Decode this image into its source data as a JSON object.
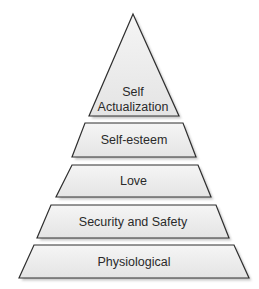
{
  "diagram": {
    "type": "pyramid",
    "colors": {
      "fill_top": "#f5f5f5",
      "fill_bottom": "#e4e4e4",
      "stroke": "#2f2f2f",
      "shadow": "#9a9a9a",
      "text": "#2a2a2a"
    },
    "tiers": [
      {
        "id": "self-actualization",
        "lines": [
          "Self",
          "Actualization"
        ],
        "points": [
          [
            133,
            14
          ],
          [
            179,
            116
          ],
          [
            89,
            116
          ]
        ],
        "label_y": [
          96,
          111
        ]
      },
      {
        "id": "self-esteem",
        "lines": [
          "Self-esteem"
        ],
        "points": [
          [
            85,
            123
          ],
          [
            183,
            123
          ],
          [
            196,
            157
          ],
          [
            72,
            157
          ]
        ],
        "label_y": [
          144
        ]
      },
      {
        "id": "love",
        "lines": [
          "Love"
        ],
        "points": [
          [
            72,
            165
          ],
          [
            198,
            165
          ],
          [
            211,
            197
          ],
          [
            56,
            197
          ]
        ],
        "label_y": [
          185
        ]
      },
      {
        "id": "security-and-safety",
        "lines": [
          "Security and Safety"
        ],
        "points": [
          [
            51,
            205
          ],
          [
            216,
            205
          ],
          [
            229,
            238
          ],
          [
            37,
            238
          ]
        ],
        "label_y": [
          226
        ]
      },
      {
        "id": "physiological",
        "lines": [
          "Physiological"
        ],
        "points": [
          [
            34,
            245
          ],
          [
            234,
            245
          ],
          [
            249,
            278
          ],
          [
            19,
            278
          ]
        ],
        "label_y": [
          266
        ]
      }
    ]
  }
}
